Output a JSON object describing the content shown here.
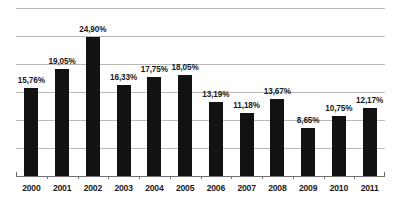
{
  "chart_data": {
    "type": "bar",
    "title": "",
    "subtitle": "",
    "xlabel": "",
    "ylabel": "",
    "categories": [
      "2000",
      "2001",
      "2002",
      "2003",
      "2004",
      "2005",
      "2006",
      "2007",
      "2008",
      "2009",
      "2010",
      "2011"
    ],
    "values": [
      15.76,
      19.05,
      24.9,
      16.33,
      17.75,
      18.05,
      13.19,
      11.18,
      13.67,
      8.65,
      10.75,
      12.17
    ],
    "value_labels": [
      "15,76%",
      "19,05%",
      "24,90%",
      "16,33%",
      "17,75%",
      "18,05%",
      "13,19%",
      "11,18%",
      "13,67%",
      "8,65%",
      "10,75%",
      "12,17%"
    ],
    "ylim": [
      0,
      30
    ],
    "grid": true,
    "gridline_values": [
      30,
      25,
      20,
      15,
      10,
      5,
      0
    ],
    "legend": null,
    "legend_position": "none",
    "bar_color": "#121212",
    "gridline_color": "#b9b9b9",
    "axis_color": "#6f6f6f",
    "background_color": "#ffffff",
    "tick_labels_y": [],
    "annotations": []
  }
}
